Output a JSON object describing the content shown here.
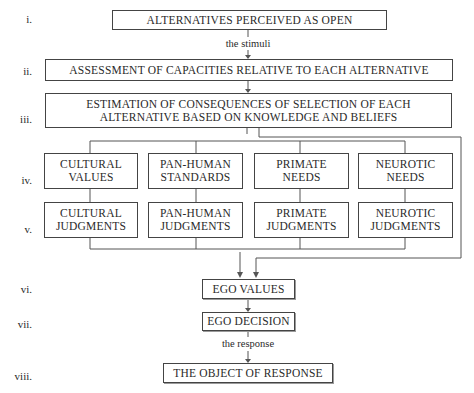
{
  "diagram": {
    "type": "flowchart",
    "stages": [
      {
        "numeral": "i.",
        "boxes": [
          {
            "lines": [
              "ALTERNATIVES PERCEIVED AS OPEN"
            ]
          }
        ]
      },
      {
        "numeral": "ii.",
        "boxes": [
          {
            "lines": [
              "ASSESSMENT OF CAPACITIES RELATIVE TO EACH ALTERNATIVE"
            ]
          }
        ]
      },
      {
        "numeral": "iii.",
        "boxes": [
          {
            "lines": [
              "ESTIMATION OF CONSEQUENCES OF SELECTION OF EACH",
              "ALTERNATIVE BASED ON KNOWLEDGE AND BELIEFS"
            ]
          }
        ]
      },
      {
        "numeral": "iv.",
        "boxes": [
          {
            "lines": [
              "CULTURAL",
              "VALUES"
            ]
          },
          {
            "lines": [
              "PAN-HUMAN",
              "STANDARDS"
            ]
          },
          {
            "lines": [
              "PRIMATE",
              "NEEDS"
            ]
          },
          {
            "lines": [
              "NEUROTIC",
              "NEEDS"
            ]
          }
        ]
      },
      {
        "numeral": "v.",
        "boxes": [
          {
            "lines": [
              "CULTURAL",
              "JUDGMENTS"
            ]
          },
          {
            "lines": [
              "PAN-HUMAN",
              "JUDGMENTS"
            ]
          },
          {
            "lines": [
              "PRIMATE",
              "JUDGMENTS"
            ]
          },
          {
            "lines": [
              "NEUROTIC",
              "JUDGMENTS"
            ]
          }
        ]
      },
      {
        "numeral": "vi.",
        "boxes": [
          {
            "lines": [
              "EGO VALUES"
            ]
          }
        ]
      },
      {
        "numeral": "vii.",
        "boxes": [
          {
            "lines": [
              "EGO DECISION"
            ]
          }
        ]
      },
      {
        "numeral": "viii.",
        "boxes": [
          {
            "lines": [
              "THE OBJECT OF RESPONSE"
            ]
          }
        ]
      }
    ],
    "edge_labels": {
      "i_to_ii": "the stimuli",
      "vii_to_viii": "the response"
    },
    "colors": {
      "stroke": "#444444",
      "text": "#2a2a2a",
      "background": "#ffffff"
    }
  }
}
